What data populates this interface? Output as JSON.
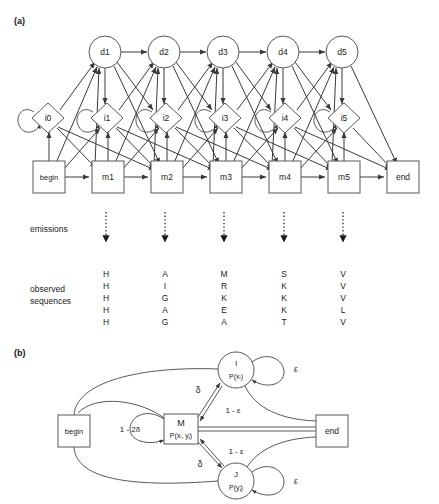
{
  "figure": {
    "panel_a_label": "(a)",
    "panel_b_label": "(b)"
  },
  "panel_a": {
    "delete_states": [
      {
        "id": "d1",
        "label": "d1",
        "cx": 105,
        "cy": 52
      },
      {
        "id": "d2",
        "label": "d2",
        "cx": 164,
        "cy": 52
      },
      {
        "id": "d3",
        "label": "d3",
        "cx": 223,
        "cy": 52
      },
      {
        "id": "d4",
        "label": "d4",
        "cx": 283,
        "cy": 52
      },
      {
        "id": "d5",
        "label": "d5",
        "cx": 342,
        "cy": 52
      }
    ],
    "insert_states": [
      {
        "id": "i0",
        "label": "i0",
        "cx": 48,
        "cy": 118
      },
      {
        "id": "i1",
        "label": "i1",
        "cx": 107,
        "cy": 118
      },
      {
        "id": "i2",
        "label": "i2",
        "cx": 166,
        "cy": 118
      },
      {
        "id": "i3",
        "label": "i3",
        "cx": 225,
        "cy": 118
      },
      {
        "id": "i4",
        "label": "i4",
        "cx": 285,
        "cy": 118
      },
      {
        "id": "i5",
        "label": "i5",
        "cx": 344,
        "cy": 118
      }
    ],
    "match_states": [
      {
        "id": "begin",
        "label": "begin",
        "cx": 49,
        "cy": 177
      },
      {
        "id": "m1",
        "label": "m1",
        "cx": 108,
        "cy": 177
      },
      {
        "id": "m2",
        "label": "m2",
        "cx": 167,
        "cy": 177
      },
      {
        "id": "m3",
        "label": "m3",
        "cx": 226,
        "cy": 177
      },
      {
        "id": "m4",
        "label": "m4",
        "cx": 285,
        "cy": 177
      },
      {
        "id": "m5",
        "label": "m5",
        "cx": 344,
        "cy": 177
      },
      {
        "id": "end",
        "label": "end",
        "cx": 403,
        "cy": 177
      }
    ],
    "emissions_label": "emissions",
    "observed_label_line1": "observed",
    "observed_label_line2": "sequences",
    "emission_columns_x": [
      106,
      165,
      224,
      284,
      343
    ],
    "observed_sequences": {
      "columns": [
        [
          "H",
          "H",
          "H",
          "H",
          "H"
        ],
        [
          "A",
          "I",
          "G",
          "A",
          "G"
        ],
        [
          "M",
          "R",
          "K",
          "E",
          "A"
        ],
        [
          "S",
          "K",
          "K",
          "K",
          "T"
        ],
        [
          "V",
          "V",
          "V",
          "L",
          "V"
        ]
      ],
      "row_y": [
        274,
        286,
        298,
        310,
        322
      ]
    }
  },
  "panel_b": {
    "nodes": {
      "begin": {
        "label": "begin",
        "x": 58,
        "y": 415,
        "w": 32,
        "h": 32
      },
      "end": {
        "label": "end",
        "x": 316,
        "y": 415,
        "w": 32,
        "h": 32
      },
      "match": {
        "label_main": "M",
        "label_sub": "P(xᵢ, yⱼ)",
        "x": 164,
        "y": 414,
        "w": 34,
        "h": 30
      },
      "insert_x": {
        "label_main": "I",
        "label_sub": "P(xᵢ)",
        "cx": 236,
        "cy": 370,
        "r": 18
      },
      "insert_y": {
        "label_main": "J",
        "label_sub": "P(yⱼ)",
        "cx": 236,
        "cy": 481,
        "r": 18
      }
    },
    "edge_labels": {
      "m_self": "1 - 2δ",
      "m_to_i_delta": "δ",
      "i_to_m_eps": "1 - ε",
      "m_to_j_delta": "δ",
      "j_to_m_eps": "1 - ε",
      "i_self_eps": "ε",
      "j_self_eps": "ε"
    }
  },
  "colors": {
    "stroke": "#58585a",
    "edge": "#3a3a3a",
    "text": "#1a1a1a",
    "background": "#ffffff"
  }
}
